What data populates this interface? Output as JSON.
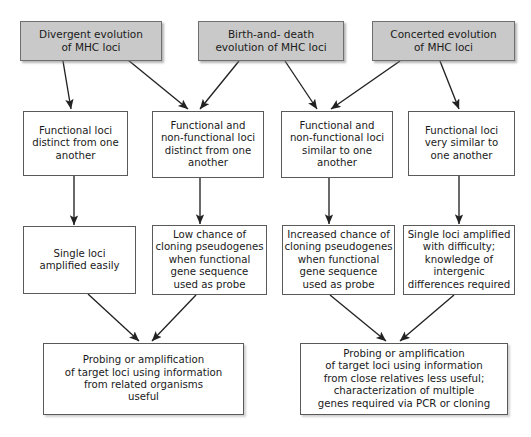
{
  "diagram": {
    "background_color": "#ffffff",
    "top_box_fill": "#c9c9c9",
    "box_border_color": "#5a5a5a",
    "arrow_color": "#222222",
    "nodes": {
      "divergent_evolution": "Divergent evolution\nof MHC loci",
      "birth_and_death": "Birth-and- death\nevolution of MHC loci",
      "concerted_evolution": "Concerted evolution\nof MHC loci",
      "functional_distinct": "Functional loci\ndistinct from one\nanother",
      "functional_nonfunctional_distinct": "Functional and\nnon-functional loci\ndistinct from one\nanother",
      "functional_nonfunctional_similar": "Functional and\nnon-functional loci\nsimilar to one\nanother",
      "functional_very_similar": "Functional loci\nvery similar to\none  another",
      "single_loci_easy": "Single loci\namplified easily",
      "low_chance_cloning": "Low chance of\ncloning pseudogenes\nwhen functional\ngene sequence\nused as probe",
      "increased_chance_cloning": "Increased chance of\ncloning pseudogenes\nwhen functional\ngene sequence\nused as probe",
      "single_loci_difficult": "Single loci amplified\nwith difficulty;\nknowledge of\nintergenic\ndifferences required",
      "outcome_related_organisms": "Probing or amplification\nof target loci using information\nfrom related organisms\nuseful",
      "outcome_close_relatives": "Probing or amplification\nof target loci using information\nfrom close relatives less useful;\ncharacterization of multiple\ngenes required via PCR or cloning"
    },
    "edges": [
      {
        "from": "divergent_evolution",
        "to": "functional_distinct"
      },
      {
        "from": "divergent_evolution",
        "to": "functional_nonfunctional_distinct"
      },
      {
        "from": "birth_and_death",
        "to": "functional_nonfunctional_distinct"
      },
      {
        "from": "birth_and_death",
        "to": "functional_nonfunctional_similar"
      },
      {
        "from": "concerted_evolution",
        "to": "functional_nonfunctional_similar"
      },
      {
        "from": "concerted_evolution",
        "to": "functional_very_similar"
      },
      {
        "from": "functional_distinct",
        "to": "single_loci_easy"
      },
      {
        "from": "functional_nonfunctional_distinct",
        "to": "low_chance_cloning"
      },
      {
        "from": "functional_nonfunctional_similar",
        "to": "increased_chance_cloning"
      },
      {
        "from": "functional_very_similar",
        "to": "single_loci_difficult"
      },
      {
        "from": "single_loci_easy",
        "to": "outcome_related_organisms"
      },
      {
        "from": "low_chance_cloning",
        "to": "outcome_related_organisms"
      },
      {
        "from": "increased_chance_cloning",
        "to": "outcome_close_relatives"
      },
      {
        "from": "single_loci_difficult",
        "to": "outcome_close_relatives"
      }
    ]
  }
}
